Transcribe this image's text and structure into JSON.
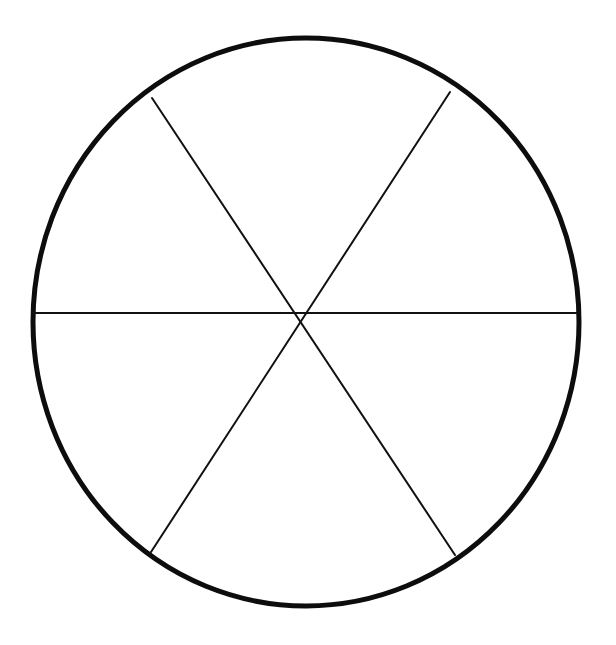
{
  "figure": {
    "canvas": {
      "width": 616,
      "height": 645,
      "background_color": "#ffffff"
    },
    "colors": {
      "stroke": "#111111",
      "outline_stroke": "#0d0d0d",
      "fill": "none",
      "background": "#ffffff"
    },
    "circle": {
      "label": "circle-outline",
      "center_x": 306,
      "center_y": 322,
      "radius_x": 273,
      "radius_y": 284,
      "stroke_width": 5,
      "leftmost_x": 33,
      "rightmost_x": 579,
      "topmost_y": 38,
      "bottommost_y": 607
    },
    "center_point": {
      "label": "chord-intersection",
      "x": 299,
      "y": 313
    },
    "chords": [
      {
        "name": "horizontal-diameter",
        "angle_degrees": 0,
        "x1": 33,
        "y1": 313,
        "x2": 579,
        "y2": 313,
        "stroke_width": 2
      },
      {
        "name": "diagonal-chord-upper-left-to-lower-right",
        "angle_degrees": 60,
        "x1": 152,
        "y1": 98,
        "x2": 455,
        "y2": 555,
        "stroke_width": 2
      },
      {
        "name": "diagonal-chord-upper-right-to-lower-left",
        "angle_degrees": -60,
        "x1": 450,
        "y1": 92,
        "x2": 151,
        "y2": 552,
        "stroke_width": 2
      }
    ],
    "sectors": {
      "count": 6,
      "names": [
        "sector-top",
        "sector-upper-right",
        "sector-lower-right",
        "sector-bottom",
        "sector-lower-left",
        "sector-upper-left"
      ]
    }
  }
}
